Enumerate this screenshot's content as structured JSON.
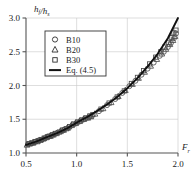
{
  "chart_data": {
    "type": "scatter",
    "title": "",
    "xlabel": "F_r",
    "xlabel_base": "F",
    "xlabel_sub": "r",
    "ylabel": "h_f/h_s",
    "ylabel_num": "h",
    "ylabel_num_sub": "f",
    "ylabel_den": "h",
    "ylabel_den_sub": "s",
    "xlim": [
      0.5,
      2.0
    ],
    "ylim": [
      1.0,
      3.0
    ],
    "xticks": [
      "0.5",
      "1.0",
      "1.5",
      "2.0"
    ],
    "xtick_values": [
      0.5,
      1.0,
      1.5,
      2.0
    ],
    "yticks": [
      "1.0",
      "1.5",
      "2.0",
      "2.5",
      "3.0"
    ],
    "ytick_values": [
      1.0,
      1.5,
      2.0,
      2.5,
      3.0
    ],
    "grid": true,
    "grid_color": "#c8c8c8",
    "axis_color": "#555555",
    "legend_position": "upper-left",
    "legend_border_color": "#333333",
    "marker_color": "#4a4a4a",
    "line_color": "#111111",
    "series": [
      {
        "name": "B10",
        "marker": "circle",
        "points": [
          [
            0.52,
            1.13
          ],
          [
            0.55,
            1.14
          ],
          [
            0.58,
            1.16
          ],
          [
            0.6,
            1.17
          ],
          [
            0.63,
            1.19
          ],
          [
            0.66,
            1.2
          ],
          [
            0.69,
            1.22
          ],
          [
            0.72,
            1.24
          ],
          [
            0.75,
            1.26
          ],
          [
            0.78,
            1.28
          ],
          [
            0.81,
            1.3
          ],
          [
            0.85,
            1.33
          ],
          [
            0.88,
            1.35
          ],
          [
            0.92,
            1.38
          ],
          [
            0.96,
            1.42
          ],
          [
            1.0,
            1.45
          ],
          [
            1.04,
            1.48
          ],
          [
            1.08,
            1.51
          ],
          [
            1.12,
            1.53
          ],
          [
            1.15,
            1.55
          ],
          [
            1.22,
            1.62
          ],
          [
            1.3,
            1.71
          ],
          [
            1.38,
            1.8
          ],
          [
            1.45,
            1.89
          ],
          [
            1.52,
            1.99
          ],
          [
            1.58,
            2.07
          ],
          [
            1.64,
            2.16
          ],
          [
            1.7,
            2.25
          ],
          [
            1.76,
            2.34
          ],
          [
            1.82,
            2.44
          ],
          [
            1.86,
            2.5
          ],
          [
            1.9,
            2.57
          ],
          [
            1.93,
            2.63
          ],
          [
            1.96,
            2.7
          ],
          [
            1.98,
            2.77
          ]
        ]
      },
      {
        "name": "B20",
        "marker": "triangle",
        "points": [
          [
            0.51,
            1.12
          ],
          [
            0.54,
            1.14
          ],
          [
            0.57,
            1.15
          ],
          [
            0.61,
            1.17
          ],
          [
            0.64,
            1.19
          ],
          [
            0.67,
            1.21
          ],
          [
            0.7,
            1.23
          ],
          [
            0.74,
            1.25
          ],
          [
            0.77,
            1.27
          ],
          [
            0.8,
            1.29
          ],
          [
            0.84,
            1.32
          ],
          [
            0.87,
            1.34
          ],
          [
            0.91,
            1.37
          ],
          [
            0.95,
            1.41
          ],
          [
            0.99,
            1.44
          ],
          [
            1.03,
            1.47
          ],
          [
            1.07,
            1.5
          ],
          [
            1.11,
            1.52
          ],
          [
            1.14,
            1.54
          ],
          [
            1.18,
            1.58
          ],
          [
            1.26,
            1.66
          ],
          [
            1.34,
            1.75
          ],
          [
            1.41,
            1.84
          ],
          [
            1.48,
            1.93
          ],
          [
            1.55,
            2.02
          ],
          [
            1.61,
            2.11
          ],
          [
            1.67,
            2.2
          ],
          [
            1.73,
            2.29
          ],
          [
            1.79,
            2.39
          ],
          [
            1.84,
            2.47
          ],
          [
            1.88,
            2.54
          ],
          [
            1.92,
            2.61
          ],
          [
            1.95,
            2.67
          ],
          [
            1.97,
            2.73
          ]
        ]
      },
      {
        "name": "B30",
        "marker": "square",
        "points": [
          [
            0.53,
            1.14
          ],
          [
            0.56,
            1.15
          ],
          [
            0.59,
            1.17
          ],
          [
            0.62,
            1.18
          ],
          [
            0.65,
            1.2
          ],
          [
            0.68,
            1.22
          ],
          [
            0.71,
            1.24
          ],
          [
            0.73,
            1.25
          ],
          [
            0.76,
            1.27
          ],
          [
            0.79,
            1.29
          ],
          [
            0.83,
            1.31
          ],
          [
            0.86,
            1.34
          ],
          [
            0.9,
            1.36
          ],
          [
            0.93,
            1.39
          ],
          [
            0.97,
            1.43
          ],
          [
            1.01,
            1.46
          ],
          [
            1.05,
            1.49
          ],
          [
            1.09,
            1.52
          ],
          [
            1.13,
            1.55
          ],
          [
            1.16,
            1.57
          ],
          [
            1.24,
            1.65
          ],
          [
            1.32,
            1.74
          ],
          [
            1.4,
            1.83
          ],
          [
            1.47,
            1.92
          ],
          [
            1.54,
            2.03
          ],
          [
            1.6,
            2.12
          ],
          [
            1.66,
            2.22
          ],
          [
            1.72,
            2.32
          ],
          [
            1.78,
            2.42
          ],
          [
            1.83,
            2.5
          ],
          [
            1.87,
            2.57
          ],
          [
            1.91,
            2.64
          ],
          [
            1.94,
            2.71
          ],
          [
            1.96,
            2.78
          ],
          [
            1.98,
            2.82
          ]
        ]
      }
    ],
    "fit_line": {
      "name": "Eq. (4.5)",
      "points": [
        [
          0.5,
          1.12
        ],
        [
          0.6,
          1.17
        ],
        [
          0.7,
          1.23
        ],
        [
          0.8,
          1.29
        ],
        [
          0.9,
          1.36
        ],
        [
          1.0,
          1.45
        ],
        [
          1.1,
          1.53
        ],
        [
          1.2,
          1.62
        ],
        [
          1.3,
          1.72
        ],
        [
          1.4,
          1.83
        ],
        [
          1.5,
          1.96
        ],
        [
          1.6,
          2.11
        ],
        [
          1.7,
          2.28
        ],
        [
          1.8,
          2.47
        ],
        [
          1.9,
          2.7
        ],
        [
          2.0,
          3.0
        ]
      ]
    },
    "legend": [
      {
        "label": "B10",
        "marker": "circle"
      },
      {
        "label": "B20",
        "marker": "triangle"
      },
      {
        "label": "B30",
        "marker": "square"
      },
      {
        "label": "Eq. (4.5)",
        "marker": "line"
      }
    ]
  }
}
